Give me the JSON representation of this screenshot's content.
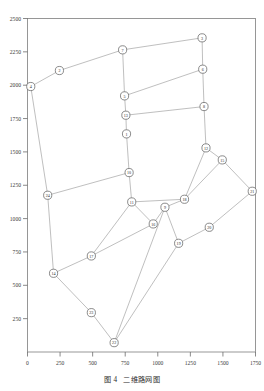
{
  "figure": {
    "caption_label": "图 4",
    "caption_text": "二维路网图",
    "background_color": "#ffffff",
    "edge_color": "#b3b3b3",
    "node_stroke_color": "#5a5a5a",
    "node_fill_color": "#ffffff",
    "frame_color": "#8c8c8c"
  },
  "chart_data": {
    "type": "scatter",
    "xlabel": "",
    "ylabel": "",
    "xlim": [
      0,
      1750
    ],
    "ylim": [
      0,
      2500
    ],
    "grid": false,
    "legend": "none",
    "xticks": [
      0,
      250,
      500,
      750,
      1000,
      1250,
      1500,
      1750
    ],
    "xtick_labels": [
      "0",
      "250",
      "500",
      "750",
      "1000",
      "1250",
      "1500",
      "1750"
    ],
    "yticks": [
      250,
      500,
      750,
      1000,
      1250,
      1500,
      1750,
      2000,
      2250,
      2500
    ],
    "ytick_labels": [
      "250",
      "500",
      "750",
      "1000",
      "1250",
      "1500",
      "1750",
      "2000",
      "2250",
      "2500"
    ],
    "nodes": [
      {
        "id": "1",
        "label": "1",
        "x": 760,
        "y": 1635
      },
      {
        "id": "2",
        "label": "2",
        "x": 245,
        "y": 2110
      },
      {
        "id": "3",
        "label": "3",
        "x": 1340,
        "y": 2355
      },
      {
        "id": "4",
        "label": "4",
        "x": 25,
        "y": 1990
      },
      {
        "id": "5",
        "label": "5",
        "x": 745,
        "y": 1920
      },
      {
        "id": "6",
        "label": "6",
        "x": 1345,
        "y": 2120
      },
      {
        "id": "7",
        "label": "7",
        "x": 730,
        "y": 2265
      },
      {
        "id": "8",
        "label": "8",
        "x": 1355,
        "y": 1840
      },
      {
        "id": "9",
        "label": "9",
        "x": 1055,
        "y": 1085
      },
      {
        "id": "10",
        "label": "10",
        "x": 780,
        "y": 1345
      },
      {
        "id": "11",
        "label": "11",
        "x": 800,
        "y": 1125
      },
      {
        "id": "12",
        "label": "12",
        "x": 1370,
        "y": 1530
      },
      {
        "id": "13",
        "label": "13",
        "x": 755,
        "y": 1775
      },
      {
        "id": "14",
        "label": "14",
        "x": 200,
        "y": 590
      },
      {
        "id": "15",
        "label": "15",
        "x": 1495,
        "y": 1440
      },
      {
        "id": "16",
        "label": "16",
        "x": 965,
        "y": 960
      },
      {
        "id": "17",
        "label": "17",
        "x": 490,
        "y": 720
      },
      {
        "id": "18",
        "label": "18",
        "x": 1205,
        "y": 1145
      },
      {
        "id": "19",
        "label": "19",
        "x": 1160,
        "y": 815
      },
      {
        "id": "20",
        "label": "20",
        "x": 1395,
        "y": 935
      },
      {
        "id": "21",
        "label": "21",
        "x": 1725,
        "y": 1205
      },
      {
        "id": "22",
        "label": "22",
        "x": 665,
        "y": 70
      },
      {
        "id": "23",
        "label": "23",
        "x": 490,
        "y": 295
      },
      {
        "id": "24",
        "label": "24",
        "x": 155,
        "y": 1175
      }
    ],
    "edges": [
      [
        "4",
        "2"
      ],
      [
        "2",
        "7"
      ],
      [
        "7",
        "3"
      ],
      [
        "3",
        "6"
      ],
      [
        "6",
        "8"
      ],
      [
        "8",
        "12"
      ],
      [
        "12",
        "15"
      ],
      [
        "15",
        "21"
      ],
      [
        "7",
        "5"
      ],
      [
        "5",
        "6"
      ],
      [
        "5",
        "13"
      ],
      [
        "13",
        "8"
      ],
      [
        "13",
        "1"
      ],
      [
        "1",
        "10"
      ],
      [
        "10",
        "11"
      ],
      [
        "11",
        "16"
      ],
      [
        "16",
        "9"
      ],
      [
        "9",
        "19"
      ],
      [
        "4",
        "24"
      ],
      [
        "24",
        "10"
      ],
      [
        "24",
        "14"
      ],
      [
        "14",
        "23"
      ],
      [
        "23",
        "22"
      ],
      [
        "22",
        "19"
      ],
      [
        "12",
        "18"
      ],
      [
        "18",
        "9"
      ],
      [
        "11",
        "18"
      ],
      [
        "14",
        "17"
      ],
      [
        "17",
        "16"
      ],
      [
        "17",
        "11"
      ],
      [
        "19",
        "20"
      ],
      [
        "20",
        "21"
      ],
      [
        "9",
        "22"
      ],
      [
        "18",
        "15"
      ]
    ]
  }
}
